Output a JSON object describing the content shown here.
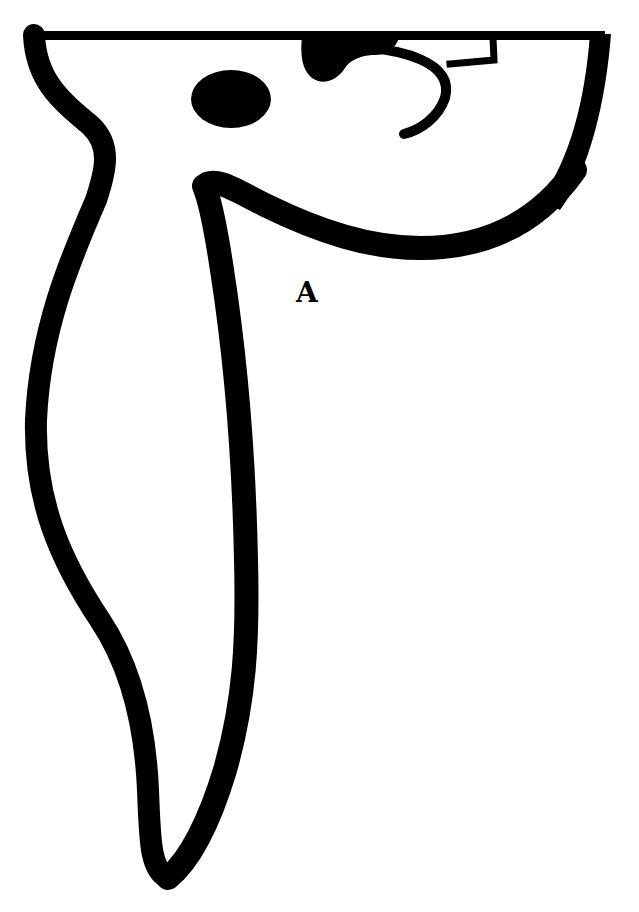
{
  "diagram": {
    "title": "",
    "labels": [
      {
        "id": "A",
        "text": "A",
        "x": 310,
        "y": 295
      }
    ],
    "colors": {
      "stroke": "#000000",
      "background": "#ffffff"
    },
    "shapes": [
      "top-bar",
      "left-outer-outline",
      "inner-curve-stroke",
      "right-arc-stroke",
      "eye-ellipse",
      "top-blob",
      "hook-stroke",
      "small-bracket"
    ]
  }
}
